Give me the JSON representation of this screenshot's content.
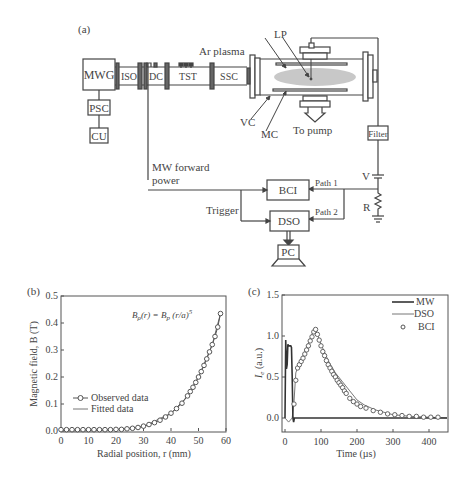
{
  "panel_a": {
    "label": "(a)",
    "blocks": {
      "mwg": "MWG",
      "psc": "PSC",
      "cu": "CU",
      "iso": "ISO",
      "dc": "DC",
      "tst": "TST",
      "ssc": "SSC",
      "bci": "BCI",
      "dso": "DSO",
      "pc": "PC",
      "filter": "Filter"
    },
    "labels": {
      "ar_plasma": "Ar plasma",
      "lp": "LP",
      "vc": "VC",
      "mc": "MC",
      "to_pump": "To pump",
      "mw_forward_1": "MW forward",
      "mw_forward_2": "power",
      "trigger": "Trigger",
      "path1": "Path 1",
      "path2": "Path 2",
      "v": "V",
      "r": "R"
    }
  },
  "chart_data": [
    {
      "panel": "(b)",
      "type": "scatter",
      "title": "",
      "annotation": "B_ρ(r) = B_p (r/a)^5",
      "xlabel": "Radial position, r (mm)",
      "ylabel": "Magnetic field, B (T)",
      "xlim": [
        0,
        60
      ],
      "ylim": [
        0,
        0.5
      ],
      "xticks": [
        0,
        10,
        20,
        30,
        40,
        50,
        60
      ],
      "yticks": [
        0.0,
        0.1,
        0.2,
        0.3,
        0.4,
        0.5
      ],
      "legend": [
        "Observed data",
        "Fitted data"
      ],
      "legend_position": "lower-left",
      "series": [
        {
          "name": "Observed data",
          "style": "circles+line",
          "x": [
            0,
            2,
            4,
            6,
            8,
            10,
            12,
            14,
            16,
            18,
            20,
            22,
            24,
            26,
            28,
            30,
            32,
            34,
            36,
            38,
            40,
            42,
            44,
            46,
            47,
            48,
            49,
            50,
            51,
            52,
            53,
            54,
            55,
            56,
            57,
            58
          ],
          "y": [
            0.005,
            0.005,
            0.005,
            0.005,
            0.005,
            0.005,
            0.005,
            0.005,
            0.005,
            0.005,
            0.006,
            0.006,
            0.008,
            0.01,
            0.013,
            0.018,
            0.024,
            0.031,
            0.04,
            0.052,
            0.066,
            0.083,
            0.103,
            0.13,
            0.146,
            0.162,
            0.18,
            0.2,
            0.22,
            0.243,
            0.267,
            0.293,
            0.32,
            0.35,
            0.385,
            0.435
          ]
        },
        {
          "name": "Fitted data",
          "style": "line",
          "x": [
            0,
            10,
            20,
            30,
            40,
            45,
            50,
            55,
            58
          ],
          "y": [
            0.0,
            0.0,
            0.005,
            0.016,
            0.066,
            0.118,
            0.2,
            0.32,
            0.435
          ]
        }
      ]
    },
    {
      "panel": "(c)",
      "type": "line",
      "title": "",
      "xlabel": "Time (µs)",
      "ylabel": "I_e (a.u.)",
      "xlim": [
        -10,
        450
      ],
      "ylim": [
        -0.15,
        1.5
      ],
      "xticks": [
        0,
        100,
        200,
        300,
        400
      ],
      "yticks": [
        0.0,
        0.5,
        1.0,
        1.5
      ],
      "legend": [
        "MW",
        "DSO",
        "BCI"
      ],
      "legend_position": "upper-right",
      "series": [
        {
          "name": "MW",
          "style": "thick line",
          "x": [
            0,
            2,
            4,
            6,
            8,
            10,
            12,
            14,
            16,
            18,
            20,
            22,
            24,
            26,
            30,
            450
          ],
          "y": [
            0.0,
            0.95,
            0.6,
            0.65,
            0.9,
            0.88,
            0.88,
            0.88,
            0.88,
            0.86,
            0.5,
            0.0,
            -0.05,
            0.0,
            0.0,
            0.0
          ]
        },
        {
          "name": "DSO",
          "style": "thin line",
          "x": [
            0,
            10,
            20,
            25,
            30,
            40,
            50,
            60,
            70,
            80,
            85,
            100,
            120,
            140,
            160,
            180,
            200,
            220,
            250,
            300,
            350,
            400,
            450
          ],
          "y": [
            0.0,
            -0.05,
            0.0,
            0.2,
            0.55,
            0.68,
            0.76,
            0.86,
            0.97,
            1.08,
            1.08,
            0.9,
            0.7,
            0.55,
            0.44,
            0.33,
            0.22,
            0.16,
            0.1,
            0.04,
            0.02,
            0.01,
            0.0
          ]
        },
        {
          "name": "BCI",
          "style": "circles",
          "x": [
            25,
            30,
            35,
            40,
            45,
            50,
            55,
            60,
            65,
            70,
            75,
            80,
            85,
            90,
            95,
            100,
            105,
            110,
            115,
            120,
            125,
            130,
            135,
            140,
            145,
            150,
            155,
            160,
            165,
            170,
            180,
            190,
            200,
            210,
            225,
            245,
            265,
            285,
            305,
            325,
            345,
            365,
            385,
            405,
            425
          ],
          "y": [
            0.17,
            0.46,
            0.61,
            0.65,
            0.69,
            0.73,
            0.78,
            0.83,
            0.88,
            0.94,
            0.99,
            1.05,
            1.08,
            1.02,
            0.95,
            0.88,
            0.81,
            0.76,
            0.7,
            0.65,
            0.61,
            0.57,
            0.53,
            0.5,
            0.46,
            0.43,
            0.4,
            0.37,
            0.33,
            0.3,
            0.24,
            0.2,
            0.17,
            0.14,
            0.12,
            0.09,
            0.07,
            0.05,
            0.04,
            0.03,
            0.02,
            0.02,
            0.01,
            0.01,
            0.01
          ]
        }
      ]
    }
  ]
}
